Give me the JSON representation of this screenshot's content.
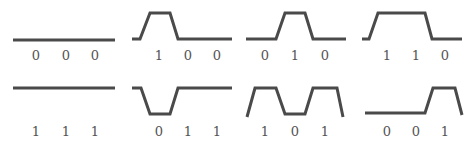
{
  "diagram": {
    "title": "",
    "stroke_color": "#4a4a4a",
    "label_color": "#555555",
    "panels": [
      {
        "id": "p000",
        "bits": [
          "0",
          "0",
          "0"
        ],
        "points": "13,40 115,40"
      },
      {
        "id": "p100",
        "bits": [
          "1",
          "0",
          "0"
        ],
        "points": "132,39 140,39 150,13 170,13 178,39 232,39"
      },
      {
        "id": "p010",
        "bits": [
          "0",
          "1",
          "0"
        ],
        "points": "246,39 276,39 285,13 305,13 313,39 346,39"
      },
      {
        "id": "p110",
        "bits": [
          "1",
          "1",
          "0"
        ],
        "points": "362,39 369,39 378,13 425,13 432,39 462,39"
      },
      {
        "id": "p111",
        "bits": [
          "1",
          "1",
          "1"
        ],
        "points": "13,88 115,88"
      },
      {
        "id": "p011",
        "bits": [
          "0",
          "1",
          "1"
        ],
        "points": "132,88 141,88 150,114 170,114 178,88 232,88"
      },
      {
        "id": "p101",
        "bits": [
          "1",
          "0",
          "1"
        ],
        "points": "247,117 255,88 276,88 285,114 305,114 313,88 337,88 343,117"
      },
      {
        "id": "p001",
        "bits": [
          "0",
          "0",
          "1"
        ],
        "points": "365,113 425,113 433,88 455,88 462,115"
      }
    ],
    "label_x": [
      [
        36,
        66,
        95
      ],
      [
        159,
        188,
        217
      ],
      [
        265,
        295,
        325
      ],
      [
        387,
        416,
        445
      ],
      [
        36,
        66,
        95
      ],
      [
        159,
        188,
        217
      ],
      [
        265,
        295,
        325
      ],
      [
        387,
        416,
        445
      ]
    ],
    "label_y": [
      60,
      60,
      60,
      60,
      136,
      136,
      136,
      136
    ]
  }
}
